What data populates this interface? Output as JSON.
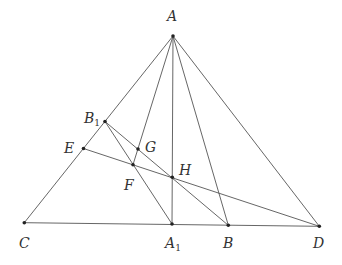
{
  "diagram": {
    "type": "geometry",
    "points": {
      "A": {
        "label": "A",
        "sub": "",
        "x": 173,
        "y": 36,
        "lx": 167,
        "ly": 21
      },
      "B1": {
        "label": "B",
        "sub": "1",
        "x": 105,
        "y": 121.5,
        "lx": 84,
        "ly": 123
      },
      "E": {
        "label": "E",
        "sub": "",
        "x": 83.5,
        "y": 148.5,
        "lx": 64,
        "ly": 153
      },
      "G": {
        "label": "G",
        "sub": "",
        "x": 138,
        "y": 149,
        "lx": 145,
        "ly": 152
      },
      "F": {
        "label": "F",
        "sub": "",
        "x": 133,
        "y": 164.7,
        "lx": 124,
        "ly": 190
      },
      "H": {
        "label": "H",
        "sub": "",
        "x": 172.3,
        "y": 177.3,
        "lx": 179,
        "ly": 175
      },
      "C": {
        "label": "C",
        "sub": "",
        "x": 24.3,
        "y": 222.7,
        "lx": 19,
        "ly": 248
      },
      "A1": {
        "label": "A",
        "sub": "1",
        "x": 172,
        "y": 224,
        "lx": 165,
        "ly": 248
      },
      "B": {
        "label": "B",
        "sub": "",
        "x": 228.3,
        "y": 225.3,
        "lx": 223,
        "ly": 248
      },
      "D": {
        "label": "D",
        "sub": "",
        "x": 319.3,
        "y": 226.3,
        "lx": 313,
        "ly": 248
      }
    },
    "segments": [
      [
        "A",
        "C"
      ],
      [
        "A",
        "D"
      ],
      [
        "C",
        "D"
      ],
      [
        "A",
        "A1"
      ],
      [
        "A",
        "B"
      ],
      [
        "A",
        "F"
      ],
      [
        "B1",
        "A1"
      ],
      [
        "B1",
        "B"
      ],
      [
        "E",
        "D"
      ]
    ]
  }
}
